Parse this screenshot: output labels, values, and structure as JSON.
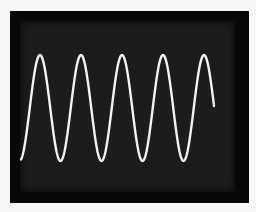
{
  "scene": {
    "subject": "oscilloscope screen displaying a sine wave",
    "background_color": "#f7f7f7",
    "frame_color": "#070707",
    "screen_color": "#1c1c1c",
    "trace_color": "#f2f2f2"
  },
  "waveform": {
    "type": "sine",
    "start_x": 21,
    "end_x": 214,
    "center_y": 108,
    "amplitude_px": 53,
    "period_px": 41,
    "first_peak_x": 40,
    "peaks_x": [
      40,
      81,
      122,
      163,
      203
    ],
    "troughs_x": [
      62,
      102,
      143,
      184
    ],
    "visible_cycles": 5
  }
}
